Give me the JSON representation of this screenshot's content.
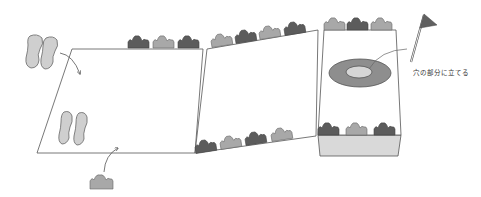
{
  "diagram": {
    "title": "",
    "colors": {
      "line": "#555555",
      "dark_shrub": "#5c5c5c",
      "light_shrub": "#a8a8a8",
      "footprint": "#cfcfcf",
      "hole_outer": "#8e8e8e",
      "hole_inner": "#d6d6d6",
      "flag": "#606060",
      "box": "#d9d9d9"
    },
    "annotations": {
      "flag_note": "穴の部分に立てる"
    },
    "elements": [
      "footprints-icon (top-left) with arrow into panel 1",
      "footprints-icon inside panel 1",
      "shrub-icon (bottom) with arrow into panel 1",
      "panel 1 (left)",
      "panel 2 (middle, sloped)",
      "panel 3 (right) with hole target",
      "flag-icon with leader line to hole",
      "shrub rows along panel edges",
      "box base under panel 3"
    ]
  }
}
